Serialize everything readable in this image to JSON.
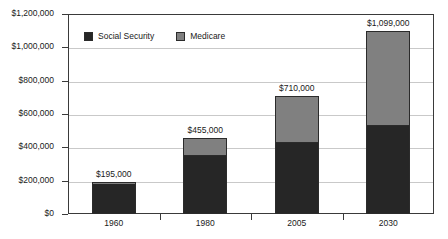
{
  "chart_data": {
    "type": "bar",
    "subtype": "stacked-column",
    "title": "",
    "subtitle": "",
    "xlabel": "",
    "ylabel": "",
    "categories": [
      "1960",
      "1980",
      "2005",
      "2030"
    ],
    "series": [
      {
        "name": "Social Security",
        "color": "#262626",
        "values": [
          193000,
          355000,
          430000,
          535000
        ]
      },
      {
        "name": "Medicare",
        "color": "#808080",
        "values": [
          2000,
          100000,
          280000,
          564000
        ]
      }
    ],
    "totals": [
      195000,
      455000,
      710000,
      1099000
    ],
    "total_labels": [
      "$195,000",
      "$455,000",
      "$710,000",
      "$1,099,000"
    ],
    "ylim": [
      0,
      1200000
    ],
    "ytick_values": [
      0,
      200000,
      400000,
      600000,
      800000,
      1000000,
      1200000
    ],
    "ytick_labels": [
      "$0",
      "$200,000",
      "$400,000",
      "$600,000",
      "$800,000",
      "$1,000,000",
      "$1,200,000"
    ],
    "grid": true,
    "grid_axis": "y",
    "legend_position": "top-left-inside",
    "legend": [
      {
        "label": "Social Security",
        "swatch": "#262626"
      },
      {
        "label": "Medicare",
        "swatch": "#808080"
      }
    ],
    "border": true,
    "background": "#ffffff"
  }
}
